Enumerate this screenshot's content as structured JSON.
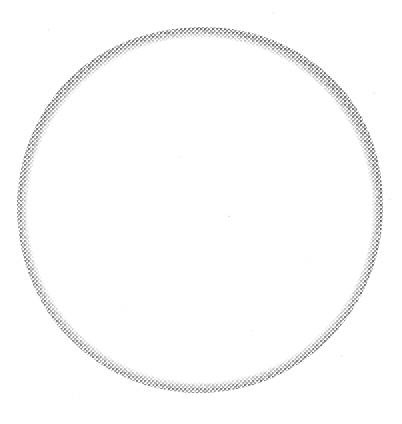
{
  "figure": {
    "shape_name": "annulus",
    "background_color": "#ffffff",
    "ink_color": "#8c8c8c",
    "ink_color_dark": "#6e6e6e",
    "ink_color_light": "#bdbdbd",
    "canvas": {
      "width": 402,
      "height": 424
    },
    "ring": {
      "center_x": 200,
      "center_y": 210,
      "outer_radius": 183,
      "inner_radius": 160,
      "band_thickness": 23,
      "texture": "halftone-dither",
      "halftone_cell_px": 2,
      "mean_gray_percent": 48
    },
    "annotations": [],
    "labels": [],
    "text": []
  }
}
